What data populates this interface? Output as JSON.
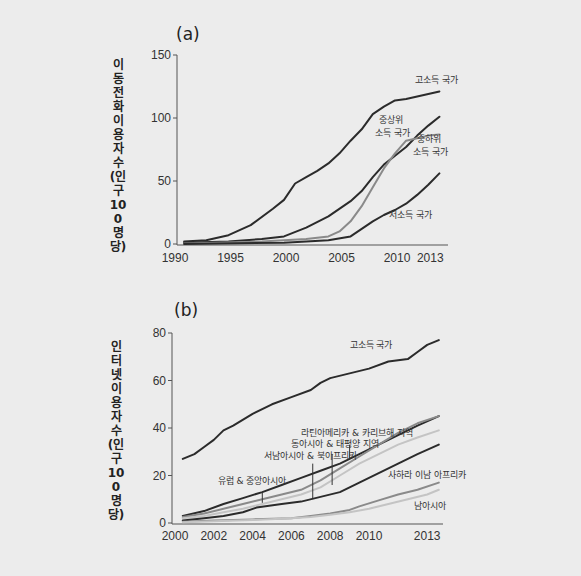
{
  "chart_data": [
    {
      "id": "a",
      "panel_label": "(a)",
      "type": "line",
      "title": "",
      "xlabel": "",
      "ylabel": "이동전화 이용자 수(인구 100명당)",
      "xlim": [
        1990,
        2014
      ],
      "ylim": [
        0,
        150
      ],
      "x_ticks": [
        1990,
        1995,
        2000,
        2005,
        2010,
        2013
      ],
      "y_ticks": [
        0,
        50,
        100,
        150
      ],
      "grid": false,
      "legend": "inline labels",
      "series": [
        {
          "name": "고소득 국가",
          "color": "#2b2b2b",
          "x": [
            1991,
            1993,
            1995,
            1997,
            1999,
            2000,
            2001,
            2002,
            2003,
            2004,
            2005,
            2006,
            2007,
            2008,
            2009,
            2010,
            2011,
            2012,
            2013,
            2014
          ],
          "values": [
            2,
            3,
            7,
            15,
            28,
            35,
            48,
            53,
            58,
            64,
            72,
            82,
            91,
            103,
            109,
            114,
            115,
            117,
            119,
            121
          ]
        },
        {
          "name": "중상위 소득 국가",
          "color": "#2b2b2b",
          "x": [
            1991,
            1995,
            1998,
            2000,
            2002,
            2004,
            2006,
            2007,
            2008,
            2009,
            2010,
            2011,
            2012,
            2013,
            2014
          ],
          "values": [
            1,
            2,
            4,
            6,
            13,
            22,
            34,
            42,
            53,
            63,
            70,
            77,
            86,
            94,
            101
          ]
        },
        {
          "name": "중하위 소득 국가",
          "color": "#8a8a8a",
          "x": [
            1991,
            1998,
            2002,
            2004,
            2005,
            2006,
            2007,
            2008,
            2009,
            2010,
            2011,
            2012,
            2013,
            2014
          ],
          "values": [
            0.5,
            2,
            4,
            6,
            10,
            18,
            30,
            45,
            60,
            72,
            82,
            84,
            86,
            87
          ]
        },
        {
          "name": "저소득 국가",
          "color": "#2b2b2b",
          "x": [
            1991,
            2000,
            2004,
            2006,
            2007,
            2008,
            2009,
            2010,
            2011,
            2012,
            2013,
            2014
          ],
          "values": [
            0,
            1,
            3,
            6,
            12,
            18,
            23,
            27,
            32,
            39,
            47,
            56
          ]
        }
      ],
      "annotations": [
        {
          "text": "고소득 국가",
          "x": 2011.8,
          "y": 128
        },
        {
          "text": "중상위",
          "x": 2008.6,
          "y": 96
        },
        {
          "text": "소득 국가",
          "x": 2008.2,
          "y": 86
        },
        {
          "text": "중하위",
          "x": 2012.0,
          "y": 81
        },
        {
          "text": "소득 국가",
          "x": 2011.6,
          "y": 71
        },
        {
          "text": "저소득 국가",
          "x": 2009.5,
          "y": 21
        }
      ]
    },
    {
      "id": "b",
      "panel_label": "(b)",
      "type": "line",
      "title": "",
      "xlabel": "",
      "ylabel": "인터넷 이용자 수(인구 100명당)",
      "xlim": [
        2000,
        2013.8
      ],
      "ylim": [
        0,
        80
      ],
      "x_ticks": [
        2000,
        2002,
        2004,
        2006,
        2008,
        2010,
        2013
      ],
      "y_ticks": [
        0,
        20,
        40,
        60,
        80
      ],
      "grid": false,
      "legend": "inline labels",
      "series": [
        {
          "name": "고소득 국가",
          "color": "#2b2b2b",
          "x": [
            2000.4,
            2001,
            2001.5,
            2002,
            2002.5,
            2003,
            2004,
            2005,
            2006,
            2007,
            2007.5,
            2008,
            2009,
            2010,
            2011,
            2012,
            2012.5,
            2013,
            2013.6
          ],
          "values": [
            27,
            29,
            32,
            35,
            39,
            41,
            46,
            50,
            53,
            56,
            59,
            61,
            63,
            65,
            68,
            69,
            72,
            75,
            77
          ]
        },
        {
          "name": "유럽 & 중앙아시아",
          "color": "#2b2b2b",
          "x": [
            2000.4,
            2001.5,
            2002.5,
            2003.5,
            2004.5,
            2005.5,
            2006.5,
            2007.5,
            2008.5,
            2009.5,
            2010.5,
            2011.5,
            2012.5,
            2013.6
          ],
          "values": [
            3,
            5,
            8,
            10.5,
            13,
            16,
            19,
            22,
            25,
            29,
            33,
            37,
            41,
            45
          ]
        },
        {
          "name": "라틴아메리카 & 카리브해 지역",
          "color": "#8a8a8a",
          "x": [
            2000.4,
            2001.5,
            2002.5,
            2003.5,
            2004.5,
            2005.5,
            2006.5,
            2007.5,
            2008.5,
            2009.5,
            2010.5,
            2011.5,
            2012.5,
            2013.6
          ],
          "values": [
            2.5,
            4,
            6,
            8,
            10,
            12,
            14,
            18,
            23,
            28,
            33,
            38,
            42,
            45
          ]
        },
        {
          "name": "동아시아 & 태평양 지역",
          "color": "#c4c4c4",
          "x": [
            2000.4,
            2001.5,
            2002.5,
            2003.5,
            2004.5,
            2005.5,
            2006.5,
            2007.5,
            2008.5,
            2009.5,
            2010.5,
            2011.5,
            2012.5,
            2013.6
          ],
          "values": [
            2,
            3,
            4.5,
            6,
            8,
            10,
            12,
            15,
            20,
            25,
            29,
            33,
            36,
            39
          ]
        },
        {
          "name": "서남아시아 & 북아프리카",
          "color": "#2b2b2b",
          "x": [
            2000.4,
            2001.5,
            2002.5,
            2003.5,
            2004.2,
            2005.5,
            2006.5,
            2007.5,
            2008.5,
            2009.5,
            2010.5,
            2011.5,
            2012.5,
            2013.6
          ],
          "values": [
            1,
            2,
            3,
            4.5,
            6.5,
            8,
            9,
            11,
            13,
            17,
            21,
            25,
            29,
            33
          ]
        },
        {
          "name": "사하라 이남 아프리카",
          "color": "#8a8a8a",
          "x": [
            2000.4,
            2002,
            2004,
            2006,
            2007,
            2008,
            2009,
            2009.5,
            2010.5,
            2011.5,
            2012.5,
            2013.6
          ],
          "values": [
            0.5,
            1,
            1.5,
            2,
            3,
            4,
            5.5,
            7,
            9.5,
            12,
            14,
            17
          ]
        },
        {
          "name": "남아시아",
          "color": "#c4c4c4",
          "x": [
            2000.4,
            2002,
            2004,
            2006,
            2007,
            2008,
            2009,
            2010,
            2011,
            2012,
            2013,
            2013.6
          ],
          "values": [
            0.3,
            0.7,
            1.2,
            2,
            2.5,
            3.5,
            4.5,
            6,
            8,
            10,
            12,
            14
          ]
        }
      ],
      "annotations": [
        {
          "text": "고소득 국가",
          "x": 2009.0,
          "y": 73.5
        },
        {
          "text": "라틴아메리카 & 카리브해 지역",
          "x": 2006.5,
          "y": 36.5
        },
        {
          "text": "동아시아 & 태평양 지역",
          "x": 2006.0,
          "y": 32.0
        },
        {
          "text": "서남아시아 & 북아프리카",
          "x": 2004.6,
          "y": 27.0
        },
        {
          "text": "유럽 & 중앙아시아",
          "x": 2002.2,
          "y": 16.5
        },
        {
          "text": "사하라 이남 아프리카",
          "x": 2011.0,
          "y": 19.0
        },
        {
          "text": "남아시아",
          "x": 2012.3,
          "y": 6.0
        }
      ],
      "leader_lines": [
        {
          "x": 2004.5,
          "y1": 13,
          "y2": 8.5
        },
        {
          "x": 2007.1,
          "y1": 25,
          "y2": 10.5
        },
        {
          "x": 2008.1,
          "y1": 29,
          "y2": 16
        },
        {
          "x": 2009.0,
          "y1": 33,
          "y2": 27
        }
      ]
    }
  ]
}
